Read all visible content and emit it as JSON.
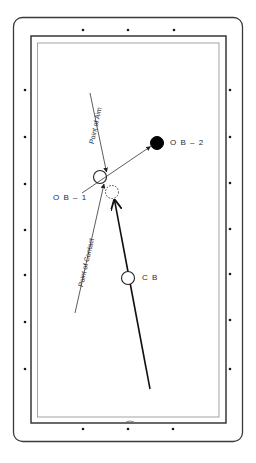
{
  "diagram": {
    "type": "billiards-shot-diagram",
    "colors": {
      "background": "#ffffff",
      "rail_outer": "#3a3a3a",
      "cushion_dark": "#2a2a2a",
      "cushion_light": "#9a9a9a",
      "diamond": "#1a1a1a",
      "line": "#222222",
      "ob2_fill": "#000000"
    },
    "labels": {
      "ob1": "O B – 1",
      "ob2": "O B – 2",
      "cb": "C B",
      "point_of_aim": "Point of Aim",
      "point_of_contact": "Point of Contact"
    },
    "balls": [
      {
        "id": "ob1",
        "cx": 100,
        "cy": 177,
        "r": 6.5,
        "style": "outline"
      },
      {
        "id": "ob2",
        "cx": 157,
        "cy": 143,
        "r": 6.5,
        "style": "filled"
      },
      {
        "id": "ghost",
        "cx": 112,
        "cy": 192,
        "r": 6.5,
        "style": "dashed"
      },
      {
        "id": "cb",
        "cx": 128,
        "cy": 278,
        "r": 6.5,
        "style": "outline"
      }
    ],
    "diamonds": {
      "top": [
        [
          83,
          30
        ],
        [
          128,
          30
        ],
        [
          174,
          30
        ]
      ],
      "bottom": [
        [
          83,
          429
        ],
        [
          128,
          429
        ],
        [
          173,
          429
        ]
      ],
      "left": [
        [
          25,
          90
        ],
        [
          25,
          137
        ],
        [
          25,
          184
        ],
        [
          25,
          230
        ],
        [
          25,
          275
        ],
        [
          25,
          322
        ],
        [
          25,
          369
        ]
      ],
      "right": [
        [
          230,
          90
        ],
        [
          230,
          137
        ],
        [
          230,
          183
        ],
        [
          230,
          229
        ],
        [
          230,
          274
        ],
        [
          230,
          320
        ],
        [
          230,
          369
        ]
      ]
    }
  }
}
